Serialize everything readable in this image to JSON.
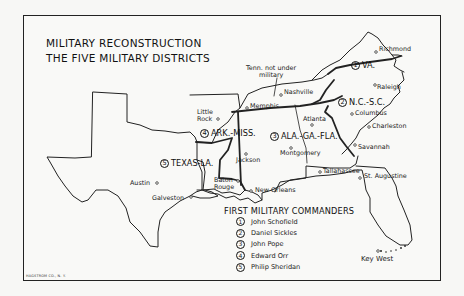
{
  "title": {
    "line1": "MILITARY RECONSTRUCTION",
    "line2": "THE FIVE MILITARY DISTRICTS"
  },
  "annotation": {
    "tennessee_note_line1": "Tenn. not under",
    "tennessee_note_line2": "military"
  },
  "districts": [
    {
      "number": "1",
      "name": "VA."
    },
    {
      "number": "2",
      "name": "N.C.-S.C."
    },
    {
      "number": "3",
      "name": "ALA.-GA.-FLA."
    },
    {
      "number": "4",
      "name": "ARK.-MISS."
    },
    {
      "number": "5",
      "name": "TEXAS-LA."
    }
  ],
  "cities": {
    "richmond": "Richmond",
    "raleigh": "Raleigh",
    "columbus": "Columbus",
    "charleston": "Charleston",
    "savannah": "Savannah",
    "nashville": "Nashville",
    "memphis": "Memphis",
    "little_rock_1": "Little",
    "little_rock_2": "Rock",
    "atlanta": "Atlanta",
    "montgomery": "Montgomery",
    "jackson": "Jackson",
    "baton_rouge_1": "Baton",
    "baton_rouge_2": "Rouge",
    "new_orleans": "New Orleans",
    "austin": "Austin",
    "galveston": "Galveston",
    "tallahassee": "Tallahassee",
    "st_augustine": "St. Augustine",
    "key_west": "Key West"
  },
  "legend": {
    "title": "FIRST MILITARY COMMANDERS",
    "items": [
      {
        "number": "1",
        "name": "John Schofield"
      },
      {
        "number": "2",
        "name": "Daniel Sickles"
      },
      {
        "number": "3",
        "name": "John Pope"
      },
      {
        "number": "4",
        "name": "Edward Orr"
      },
      {
        "number": "5",
        "name": "Philip Sheridan"
      }
    ]
  },
  "credit": "HAGSTROM CO., N. Y.",
  "colors": {
    "ink": "#111111",
    "paper": "#f9f9f7"
  }
}
